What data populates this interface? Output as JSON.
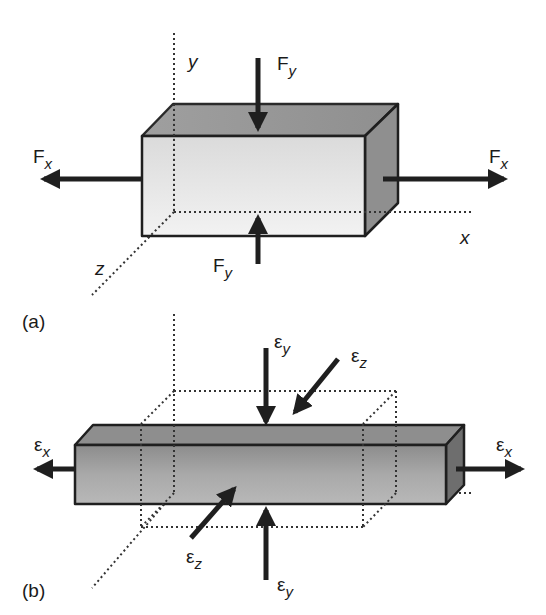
{
  "figure": {
    "panel_a": {
      "label": "(a)",
      "axes": {
        "x": "x",
        "y": "y",
        "z": "z"
      },
      "forces": [
        {
          "name": "F",
          "sub": "x",
          "direction": "left"
        },
        {
          "name": "F",
          "sub": "x",
          "direction": "right"
        },
        {
          "name": "F",
          "sub": "y",
          "direction": "down"
        },
        {
          "name": "F",
          "sub": "y",
          "direction": "up"
        }
      ]
    },
    "panel_b": {
      "label": "(b)",
      "strains": [
        {
          "name": "ε",
          "sub": "x",
          "direction": "left"
        },
        {
          "name": "ε",
          "sub": "x",
          "direction": "right"
        },
        {
          "name": "ε",
          "sub": "y",
          "direction": "down"
        },
        {
          "name": "ε",
          "sub": "y",
          "direction": "up"
        },
        {
          "name": "ε",
          "sub": "z",
          "direction": "inward-top"
        },
        {
          "name": "ε",
          "sub": "z",
          "direction": "inward-bottom"
        }
      ]
    },
    "colors": {
      "stroke": "#1f1f1f",
      "front_light": "#ececec",
      "front_dark": "#c8c8c8",
      "side": "#8e8e8e",
      "bar_front": "#a8a8a8",
      "bar_top": "#8a8a8a"
    }
  }
}
